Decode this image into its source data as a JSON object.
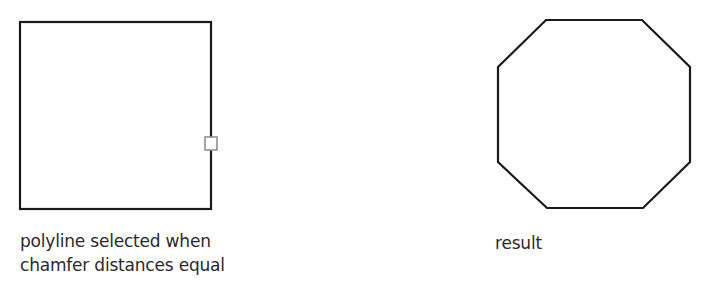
{
  "figures": [
    {
      "name": "polyline-square",
      "shape": "square",
      "caption_lines": [
        "polyline selected when",
        "chamfer distances equal"
      ],
      "pickbox": true
    },
    {
      "name": "result-octagon",
      "shape": "octagon",
      "caption_lines": [
        "result"
      ]
    }
  ],
  "colors": {
    "stroke": "#1a1a1a",
    "pickbox": "#8a8a8a",
    "text": "#2a2a2a"
  }
}
